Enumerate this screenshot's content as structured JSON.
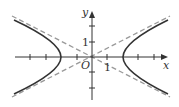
{
  "diagram": {
    "type": "hyperbola with asymptotes",
    "axis_labels": {
      "x": "x",
      "y": "y",
      "origin": "O"
    },
    "tick_labels": {
      "x_one": "1",
      "y_one": "1"
    },
    "vertices": [
      -2,
      2
    ],
    "asymptote_slope": 0.5,
    "colors": {
      "curve": "#333333",
      "asymptote": "#999999",
      "axis": "#333333"
    }
  }
}
